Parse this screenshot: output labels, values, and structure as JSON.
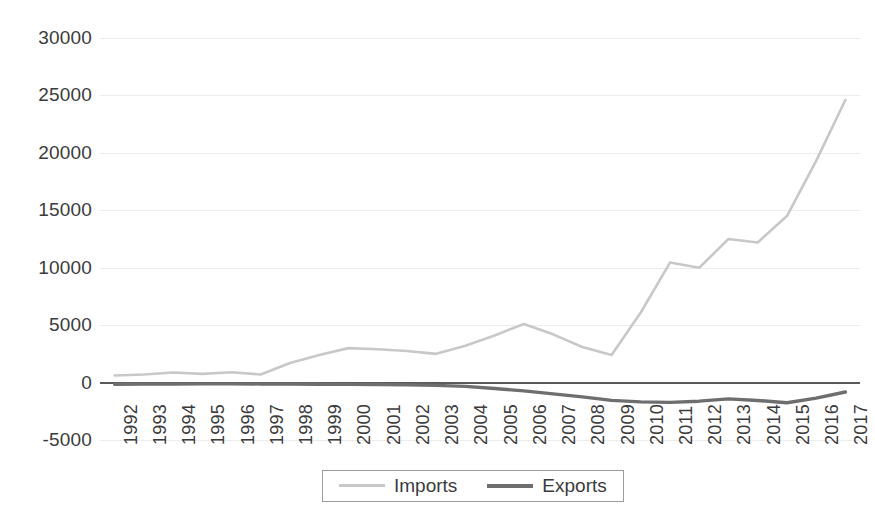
{
  "chart_data": {
    "type": "line",
    "title": "",
    "subtitle": "",
    "xlabel": "",
    "ylabel": "",
    "grid": true,
    "legend_position": "bottom",
    "ylim": [
      -5000,
      30000
    ],
    "ytick_labels": [
      "30000",
      "25000",
      "20000",
      "15000",
      "10000",
      "5000",
      "0",
      "-5000"
    ],
    "ytick_values": [
      30000,
      25000,
      20000,
      15000,
      10000,
      5000,
      0,
      -5000
    ],
    "categories": [
      "1992",
      "1993",
      "1994",
      "1995",
      "1996",
      "1997",
      "1998",
      "1999",
      "2000",
      "2001",
      "2002",
      "2003",
      "2004",
      "2005",
      "2006",
      "2007",
      "2008",
      "2009",
      "2010",
      "2011",
      "2012",
      "2013",
      "2014",
      "2015",
      "2016",
      "2017"
    ],
    "series": [
      {
        "name": "Imports",
        "color": "#c8c8c8",
        "values": [
          620,
          700,
          880,
          760,
          900,
          700,
          1700,
          2400,
          3000,
          2900,
          2750,
          2500,
          3200,
          4100,
          5100,
          4200,
          3100,
          2400,
          6100,
          10450,
          10000,
          12500,
          12200,
          14500,
          19300,
          24600
        ]
      },
      {
        "name": "Exports",
        "color": "#6e6e6e",
        "values": [
          -150,
          -130,
          -120,
          -110,
          -110,
          -120,
          -130,
          -140,
          -160,
          -170,
          -200,
          -240,
          -330,
          -520,
          -720,
          -980,
          -1250,
          -1550,
          -1680,
          -1720,
          -1620,
          -1420,
          -1560,
          -1760,
          -1350,
          -820
        ]
      }
    ]
  },
  "legend": {
    "items": [
      {
        "label": "Imports",
        "color": "#c8c8c8",
        "stroke_width": 3
      },
      {
        "label": "Exports",
        "color": "#6e6e6e",
        "stroke_width": 4
      }
    ]
  },
  "axis_colors": {
    "gridline": "#ececed",
    "zero_axis": "#5a5a5a",
    "tick_text": "#3b3b3b",
    "legend_border": "#9b9b9b",
    "background": "#ffffff"
  }
}
